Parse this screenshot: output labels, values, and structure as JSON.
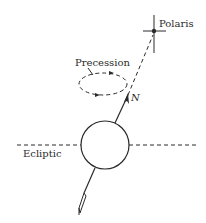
{
  "diagram": {
    "labels": {
      "polaris": "Polaris",
      "precession": "Precession",
      "north": "N",
      "ecliptic": "Ecliptic"
    },
    "colors": {
      "ink": "#2a2a2a",
      "background": "#ffffff"
    }
  }
}
